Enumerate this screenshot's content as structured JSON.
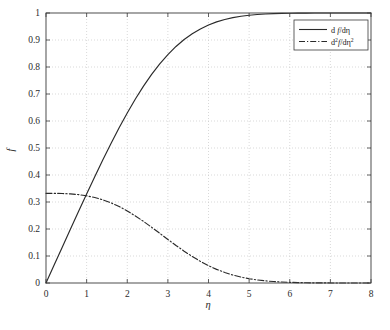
{
  "figure": {
    "background": "#ffffff",
    "axes_color": "#3a3a3a",
    "grid_color": "#c8c8c8",
    "curve_color": "#2a2a2a"
  },
  "axis": {
    "x_label": "η",
    "y_label": "f",
    "x_ticks": [
      "0",
      "1",
      "2",
      "3",
      "4",
      "5",
      "6",
      "7",
      "8"
    ],
    "y_ticks": [
      "0",
      "0.1",
      "0.2",
      "0.3",
      "0.4",
      "0.5",
      "0.6",
      "0.7",
      "0.8",
      "0.9",
      "1"
    ]
  },
  "legend": {
    "position": "top-right",
    "entries": [
      {
        "style": "solid",
        "prefix": "d ",
        "fn": "f",
        "mid": "/d",
        "var": "η",
        "sup_num": "",
        "sup_den": ""
      },
      {
        "style": "dash-dot",
        "prefix": "d",
        "fn": "f",
        "mid": "/d",
        "var": "η",
        "sup_num": "2",
        "sup_den": "2"
      }
    ],
    "label_1": "d f/dη",
    "label_2": "d²f/dη²"
  },
  "chart_data": {
    "type": "line",
    "title": "",
    "xlabel": "η",
    "ylabel": "f",
    "xlim": [
      0,
      8
    ],
    "ylim": [
      0,
      1
    ],
    "grid": true,
    "legend_position": "upper right",
    "x": [
      0,
      0.2,
      0.4,
      0.6,
      0.8,
      1.0,
      1.2,
      1.4,
      1.6,
      1.8,
      2.0,
      2.2,
      2.4,
      2.6,
      2.8,
      3.0,
      3.2,
      3.4,
      3.6,
      3.8,
      4.0,
      4.2,
      4.4,
      4.6,
      4.8,
      5.0,
      5.2,
      5.4,
      5.6,
      5.8,
      6.0,
      6.2,
      6.4,
      6.6,
      6.8,
      7.0,
      7.2,
      7.4,
      7.6,
      7.8,
      8.0
    ],
    "series": [
      {
        "name": "d f/dη",
        "style": "solid",
        "values": [
          0.0,
          0.0664,
          0.1328,
          0.1989,
          0.2647,
          0.3298,
          0.3938,
          0.4563,
          0.5168,
          0.5748,
          0.6298,
          0.6813,
          0.729,
          0.7725,
          0.8115,
          0.8461,
          0.8761,
          0.9018,
          0.9233,
          0.9411,
          0.9555,
          0.967,
          0.9759,
          0.9827,
          0.9878,
          0.9916,
          0.9943,
          0.9962,
          0.9975,
          0.9984,
          0.999,
          0.9994,
          0.9996,
          0.9998,
          0.9999,
          0.9999,
          1.0,
          1.0,
          1.0,
          1.0,
          1.0
        ]
      },
      {
        "name": "d²f/dη²",
        "style": "dash-dot",
        "values": [
          0.3321,
          0.332,
          0.3315,
          0.3301,
          0.3274,
          0.323,
          0.3166,
          0.3079,
          0.2967,
          0.2833,
          0.2668,
          0.2484,
          0.2281,
          0.2065,
          0.184,
          0.1614,
          0.1391,
          0.1179,
          0.0981,
          0.0801,
          0.0642,
          0.0505,
          0.039,
          0.0295,
          0.0219,
          0.0159,
          0.0113,
          0.0079,
          0.0054,
          0.0036,
          0.0024,
          0.0015,
          0.0009,
          0.0006,
          0.0003,
          0.0002,
          0.0001,
          0.0001,
          0.0,
          0.0,
          0.0
        ]
      }
    ]
  }
}
